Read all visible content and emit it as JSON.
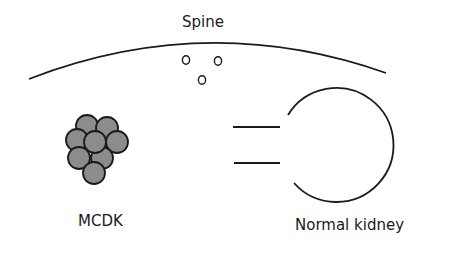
{
  "labels": {
    "spine": "Spine",
    "mcdk": "MCDK",
    "normal_kidney": "Normal kidney"
  },
  "colors": {
    "line": "#1a1a1a",
    "cyst_fill": "#8c8c8c",
    "background": "#ffffff"
  },
  "elements": {
    "vertebrae_count": 3,
    "cyst_count": 8,
    "ureter_lines": 2
  }
}
